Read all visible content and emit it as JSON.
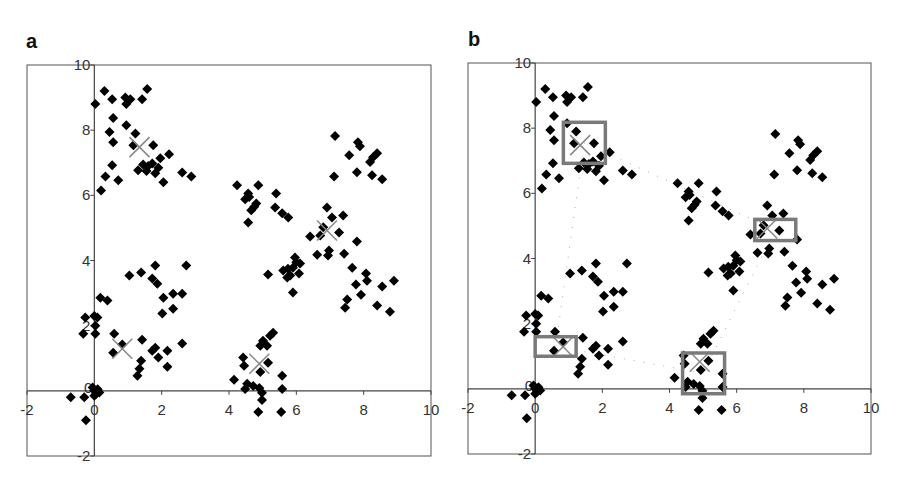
{
  "chart_data": [
    {
      "panel": "a",
      "type": "scatter",
      "title": "",
      "xlabel": "",
      "ylabel": "",
      "xlim": [
        -2,
        10
      ],
      "ylim": [
        -2,
        10
      ],
      "xticks": [
        -2,
        0,
        2,
        4,
        6,
        8,
        10
      ],
      "yticks": [
        -2,
        0,
        2,
        4,
        6,
        8,
        10
      ],
      "grid": false,
      "legend": null,
      "series": [
        {
          "name": "points",
          "marker": "diamond",
          "color": "#000000",
          "points": [
            [
              0.03,
              8.8
            ],
            [
              0.3,
              9.2
            ],
            [
              0.53,
              8.95
            ],
            [
              0.92,
              9.0
            ],
            [
              1.07,
              8.95
            ],
            [
              0.95,
              8.8
            ],
            [
              1.42,
              8.95
            ],
            [
              1.57,
              9.26
            ],
            [
              0.56,
              8.37
            ],
            [
              0.95,
              8.15
            ],
            [
              0.45,
              7.94
            ],
            [
              0.56,
              7.63
            ],
            [
              1.22,
              7.9
            ],
            [
              1.75,
              7.54
            ],
            [
              1.16,
              7.54
            ],
            [
              2.22,
              7.26
            ],
            [
              1.45,
              6.95
            ],
            [
              1.72,
              6.98
            ],
            [
              1.96,
              7.14
            ],
            [
              1.3,
              6.77
            ],
            [
              1.81,
              6.68
            ],
            [
              2.05,
              6.4
            ],
            [
              0.53,
              6.92
            ],
            [
              0.33,
              6.58
            ],
            [
              0.71,
              6.46
            ],
            [
              0.2,
              6.15
            ],
            [
              2.61,
              6.7
            ],
            [
              2.88,
              6.58
            ],
            [
              1.6,
              6.9
            ],
            [
              1.9,
              6.85
            ],
            [
              1.55,
              6.75
            ],
            [
              4.24,
              6.31
            ],
            [
              4.87,
              6.31
            ],
            [
              4.57,
              6.06
            ],
            [
              4.48,
              5.88
            ],
            [
              4.81,
              5.75
            ],
            [
              4.66,
              5.54
            ],
            [
              4.57,
              5.17
            ],
            [
              5.4,
              6.06
            ],
            [
              5.37,
              5.63
            ],
            [
              5.58,
              5.45
            ],
            [
              5.76,
              5.32
            ],
            [
              4.6,
              5.95
            ],
            [
              4.75,
              5.65
            ],
            [
              7.15,
              7.82
            ],
            [
              7.83,
              7.63
            ],
            [
              7.89,
              7.51
            ],
            [
              7.57,
              7.23
            ],
            [
              8.4,
              7.29
            ],
            [
              8.28,
              7.17
            ],
            [
              8.19,
              7.02
            ],
            [
              7.12,
              6.58
            ],
            [
              7.8,
              6.71
            ],
            [
              8.25,
              6.62
            ],
            [
              8.55,
              6.49
            ],
            [
              6.91,
              5.63
            ],
            [
              7.06,
              5.32
            ],
            [
              7.39,
              5.38
            ],
            [
              6.8,
              5.02
            ],
            [
              7.27,
              4.86
            ],
            [
              6.41,
              4.74
            ],
            [
              6.71,
              4.77
            ],
            [
              7.8,
              4.58
            ],
            [
              6.62,
              4.18
            ],
            [
              6.97,
              4.31
            ],
            [
              6.94,
              4.15
            ],
            [
              7.42,
              4.21
            ],
            [
              7.66,
              3.78
            ],
            [
              8.07,
              3.6
            ],
            [
              8.1,
              3.38
            ],
            [
              7.77,
              3.26
            ],
            [
              8.9,
              3.38
            ],
            [
              8.55,
              3.2
            ],
            [
              7.92,
              2.95
            ],
            [
              7.51,
              2.8
            ],
            [
              7.45,
              2.55
            ],
            [
              8.4,
              2.62
            ],
            [
              8.78,
              2.43
            ],
            [
              5.96,
              4.09
            ],
            [
              6.11,
              3.91
            ],
            [
              5.9,
              3.78
            ],
            [
              5.61,
              3.69
            ],
            [
              5.82,
              3.54
            ],
            [
              6.08,
              3.6
            ],
            [
              5.16,
              3.57
            ],
            [
              5.9,
              3.02
            ],
            [
              5.73,
              3.48
            ],
            [
              6.0,
              3.95
            ],
            [
              5.75,
              3.75
            ],
            [
              1.04,
              3.54
            ],
            [
              1.39,
              3.63
            ],
            [
              1.81,
              3.85
            ],
            [
              2.73,
              3.85
            ],
            [
              1.72,
              3.45
            ],
            [
              1.87,
              3.29
            ],
            [
              2.05,
              2.86
            ],
            [
              2.34,
              2.98
            ],
            [
              2.61,
              2.98
            ],
            [
              2.34,
              2.52
            ],
            [
              2.02,
              2.37
            ],
            [
              0.18,
              2.86
            ],
            [
              0.39,
              2.77
            ],
            [
              -0.27,
              2.25
            ],
            [
              0.09,
              2.25
            ],
            [
              0.03,
              2.0
            ],
            [
              -0.33,
              1.75
            ],
            [
              0.03,
              1.75
            ],
            [
              0.0,
              2.3
            ],
            [
              0.59,
              1.75
            ],
            [
              0.83,
              1.42
            ],
            [
              0.56,
              1.17
            ],
            [
              1.42,
              1.57
            ],
            [
              1.81,
              1.32
            ],
            [
              1.72,
              1.23
            ],
            [
              1.9,
              1.02
            ],
            [
              2.17,
              1.23
            ],
            [
              2.17,
              0.74
            ],
            [
              2.61,
              1.45
            ],
            [
              1.39,
              0.92
            ],
            [
              1.34,
              0.68
            ],
            [
              1.28,
              0.46
            ],
            [
              5.31,
              1.78
            ],
            [
              5.22,
              1.69
            ],
            [
              5.01,
              1.54
            ],
            [
              4.93,
              1.38
            ],
            [
              5.13,
              1.38
            ],
            [
              4.42,
              1.02
            ],
            [
              4.45,
              0.77
            ],
            [
              5.16,
              0.86
            ],
            [
              4.93,
              0.58
            ],
            [
              4.15,
              0.34
            ],
            [
              5.58,
              0.46
            ],
            [
              4.54,
              0.22
            ],
            [
              4.72,
              0.15
            ],
            [
              4.9,
              0.09
            ],
            [
              5.58,
              0.06
            ],
            [
              4.48,
              0.06
            ],
            [
              4.98,
              -0.06
            ],
            [
              4.98,
              -0.28
            ],
            [
              4.87,
              -0.65
            ],
            [
              5.55,
              -0.65
            ],
            [
              0.0,
              0.0
            ],
            [
              0.1,
              0.05
            ],
            [
              0.05,
              -0.1
            ],
            [
              -0.05,
              0.1
            ],
            [
              0.15,
              -0.05
            ],
            [
              0.0,
              -0.15
            ],
            [
              -0.7,
              -0.2
            ],
            [
              -0.3,
              -0.2
            ],
            [
              -0.25,
              -0.9
            ]
          ]
        },
        {
          "name": "centroids",
          "marker": "x",
          "color": "#888888",
          "points": [
            [
              1.34,
              7.48
            ],
            [
              6.91,
              4.92
            ],
            [
              0.83,
              1.29
            ],
            [
              4.9,
              0.83
            ]
          ]
        }
      ]
    },
    {
      "panel": "b",
      "type": "scatter",
      "title": "",
      "xlabel": "",
      "ylabel": "",
      "xlim": [
        -2,
        10
      ],
      "ylim": [
        -2,
        10
      ],
      "xticks": [
        -2,
        0,
        2,
        4,
        6,
        8,
        10
      ],
      "yticks": [
        -2,
        0,
        2,
        4,
        6,
        8,
        10
      ],
      "grid": false,
      "legend": null,
      "same_points_as": "a",
      "boxes": [
        {
          "x0": 0.84,
          "x1": 2.09,
          "y0": 6.92,
          "y1": 8.18
        },
        {
          "x0": 6.54,
          "x1": 7.76,
          "y0": 4.55,
          "y1": 5.2
        },
        {
          "x0": 0.0,
          "x1": 1.22,
          "y0": 1.0,
          "y1": 1.6
        },
        {
          "x0": 4.39,
          "x1": 5.64,
          "y0": -0.15,
          "y1": 1.1
        }
      ],
      "box_color": "#7a7a7a",
      "dotted_path": [
        [
          1.46,
          7.55
        ],
        [
          7.15,
          4.88
        ],
        [
          5.0,
          0.48
        ],
        [
          0.61,
          1.3
        ],
        [
          1.46,
          7.55
        ]
      ]
    }
  ],
  "panels": [
    {
      "label": "a",
      "frame": {
        "left": 27,
        "top": 65,
        "right": 431,
        "bottom": 456
      }
    },
    {
      "label": "b",
      "frame": {
        "left": 468,
        "top": 63,
        "right": 871,
        "bottom": 454
      }
    }
  ]
}
